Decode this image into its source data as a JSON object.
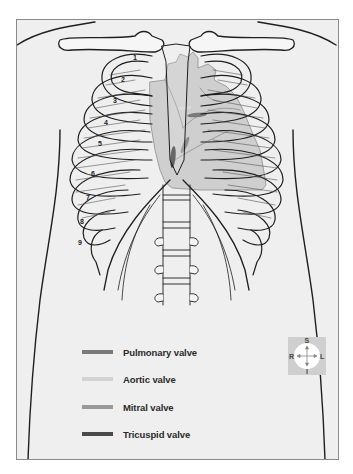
{
  "figure": {
    "rib_numbers": [
      "1",
      "2",
      "3",
      "4",
      "5",
      "6",
      "7",
      "8",
      "9"
    ]
  },
  "colors": {
    "background": "#efefef",
    "frame_border": "#8a8a8a",
    "heart_fill": "#bdbdbd",
    "pulmonary_valve": "#7a7a7a",
    "aortic_valve": "#d2d2d2",
    "mitral_valve": "#9a9a9a",
    "tricuspid_valve": "#4a4a4a"
  },
  "legend": {
    "items": [
      {
        "label": "Pulmonary valve",
        "color": "#7a7a7a"
      },
      {
        "label": "Aortic valve",
        "color": "#d2d2d2"
      },
      {
        "label": "Mitral valve",
        "color": "#9a9a9a"
      },
      {
        "label": "Tricuspid valve",
        "color": "#4a4a4a"
      }
    ]
  },
  "compass": {
    "top": "S",
    "bottom": "I",
    "left": "R",
    "right": "L"
  }
}
